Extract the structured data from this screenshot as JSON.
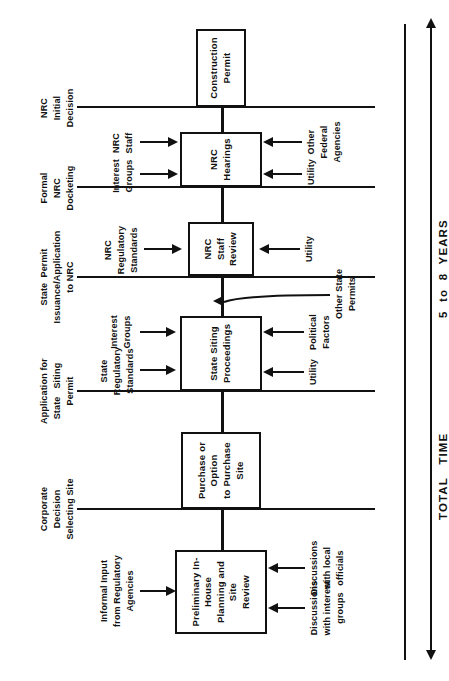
{
  "diagram": {
    "orientation": "rotated-90-ccw",
    "ink_color": "#111111",
    "background": "#ffffff"
  },
  "stages": [
    {
      "id": "preliminary",
      "box": "Preliminary In-House\nPlanning  and  Site\nReview",
      "box_lines": [
        "Preliminary In-House",
        "Planning  and  Site",
        "Review"
      ],
      "inputs_left": [
        "Informal Input\nfrom Regulatory\nAgencies"
      ],
      "inputs_right": [
        "Discussions\nwith interest\ngroups",
        "Discussions\nwith local\nofficials"
      ]
    },
    {
      "id": "purchase",
      "box": "Purchase or Option\nto   Purchase\nSite",
      "box_lines": [
        "Purchase or Option",
        "to   Purchase",
        "Site"
      ],
      "inputs_left": [],
      "inputs_right": []
    },
    {
      "id": "state-siting",
      "box": "State  Siting\nProceedings",
      "box_lines": [
        "State  Siting",
        "Proceedings"
      ],
      "inputs_left": [
        "State\nRegulatory\nStandards",
        "Interest\nGroups"
      ],
      "inputs_right": [
        "Utility",
        "Political\nFactors"
      ]
    },
    {
      "id": "nrc-staff-review",
      "box": "NRC\nStaff\nReview",
      "box_lines": [
        "NRC",
        "Staff",
        "Review"
      ],
      "inputs_left": [
        "NRC\nRegulatory\nStandards"
      ],
      "inputs_right": [
        "Utility"
      ]
    },
    {
      "id": "nrc-hearings",
      "box": "NRC\nHearings",
      "box_lines": [
        "NRC",
        "Hearings"
      ],
      "inputs_left": [
        "NRC\nStaff",
        "Interest\nGroups"
      ],
      "inputs_right": [
        "Other\nFederal\nAgencies",
        "Utility"
      ]
    },
    {
      "id": "construction-permit",
      "box": "Construction\nPermit",
      "box_lines": [
        "Construction",
        "Permit"
      ],
      "inputs_left": [],
      "inputs_right": []
    }
  ],
  "milestones": [
    {
      "id": "corporate-decision",
      "label": "Corporate\nDecision\nSelecting Site"
    },
    {
      "id": "application-state-permit",
      "label": "Application for\nState   Siting\nPermit"
    },
    {
      "id": "state-permit-issuance",
      "label": "State  Permit\nIssuance/Application\nto NRC"
    },
    {
      "id": "formal-nrc-docketing",
      "label": "Formal\nNRC\nDocketing"
    },
    {
      "id": "nrc-initial-decision",
      "label": "NRC\nInitial\nDecision"
    }
  ],
  "side_notes": [
    {
      "id": "other-state-permits",
      "label": "Other State\nPermits"
    }
  ],
  "time_rail": {
    "label_left": "TOTAL   TIME",
    "label_right": "5  to  8  YEARS",
    "full_label": "TOTAL   TIME    5  to  8  YEARS",
    "direction": "double-headed"
  }
}
